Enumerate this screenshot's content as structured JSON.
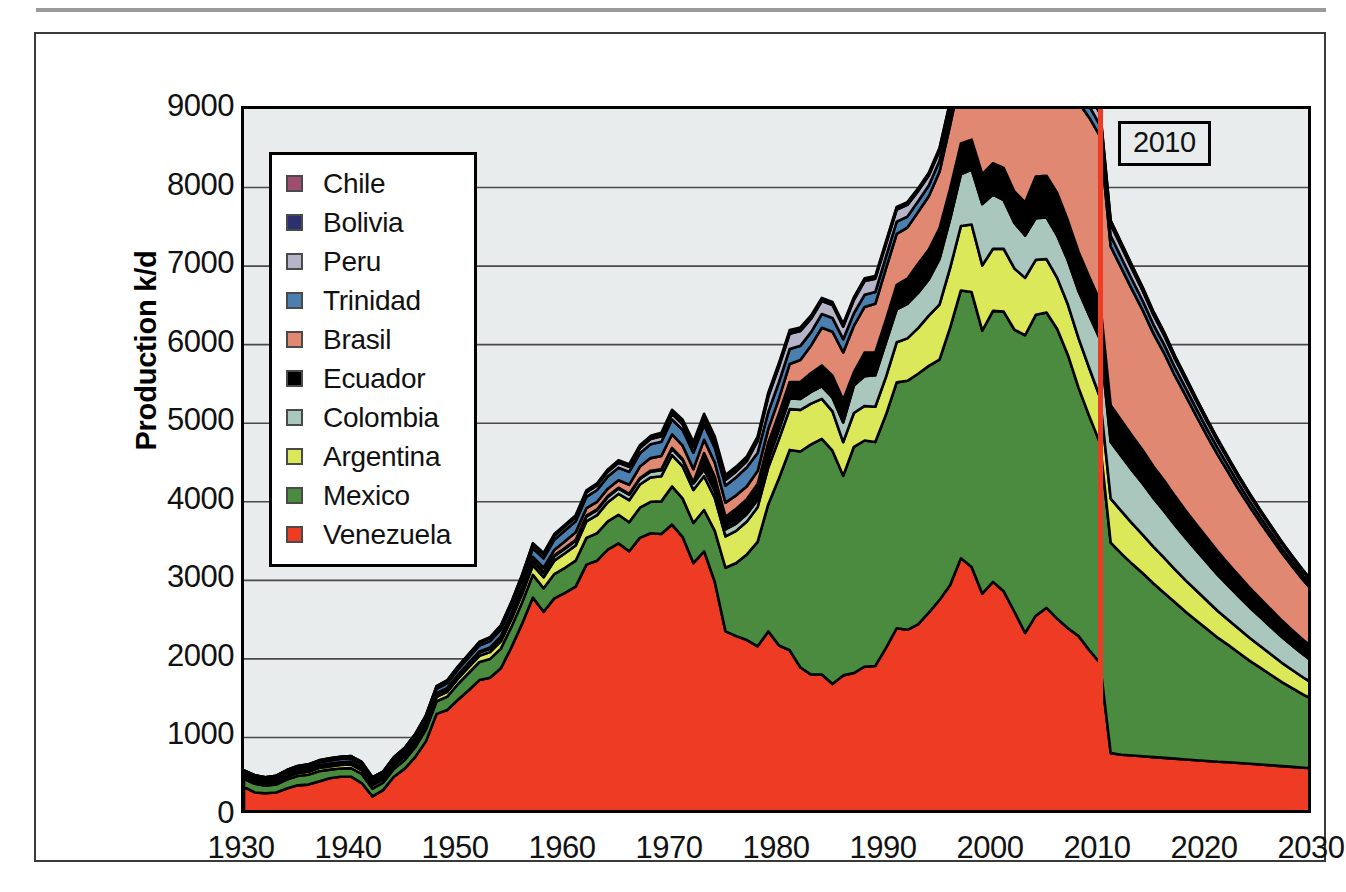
{
  "figure": {
    "title": "",
    "marker_label": "2010",
    "marker_year": 2010,
    "marker_color": "#ee3b24",
    "plot_background": "#e9ecec"
  },
  "axes": {
    "ylabel": "Production k/d",
    "yticks": [
      "0",
      "1000",
      "2000",
      "3000",
      "4000",
      "5000",
      "6000",
      "7000",
      "8000",
      "9000"
    ],
    "xticks": [
      "1930",
      "1940",
      "1950",
      "1960",
      "1970",
      "1980",
      "1990",
      "2000",
      "2010",
      "2020",
      "2030"
    ]
  },
  "legend": {
    "items": [
      {
        "label": "Chile",
        "color": "#9e4f6e"
      },
      {
        "label": "Bolivia",
        "color": "#2b3070"
      },
      {
        "label": "Peru",
        "color": "#b6b4c8"
      },
      {
        "label": "Trinidad",
        "color": "#4a7fb0"
      },
      {
        "label": "Brasil",
        "color": "#e08872"
      },
      {
        "label": "Ecuador",
        "color": "#000000"
      },
      {
        "label": "Colombia",
        "color": "#aac7bd"
      },
      {
        "label": "Argentina",
        "color": "#dbe85a"
      },
      {
        "label": "Mexico",
        "color": "#4b8b40"
      },
      {
        "label": "Venezuela",
        "color": "#ee3b24"
      }
    ]
  },
  "chart_data": {
    "type": "area",
    "stacked": true,
    "title": "",
    "xlabel": "",
    "ylabel": "Production k/d",
    "xlim": [
      1930,
      2030
    ],
    "ylim": [
      0,
      9000
    ],
    "grid": true,
    "legend_position": "inside-upper-left",
    "annotations": [
      {
        "type": "vline",
        "x": 2010,
        "label": "2010",
        "color": "#ee3b24"
      }
    ],
    "x": [
      1930,
      1931,
      1932,
      1933,
      1934,
      1935,
      1936,
      1937,
      1938,
      1939,
      1940,
      1941,
      1942,
      1943,
      1944,
      1945,
      1946,
      1947,
      1948,
      1949,
      1950,
      1951,
      1952,
      1953,
      1954,
      1955,
      1956,
      1957,
      1958,
      1959,
      1960,
      1961,
      1962,
      1963,
      1964,
      1965,
      1966,
      1967,
      1968,
      1969,
      1970,
      1971,
      1972,
      1973,
      1974,
      1975,
      1976,
      1977,
      1978,
      1979,
      1980,
      1981,
      1982,
      1983,
      1984,
      1985,
      1986,
      1987,
      1988,
      1989,
      1990,
      1991,
      1992,
      1993,
      1994,
      1995,
      1996,
      1997,
      1998,
      1999,
      2000,
      2001,
      2002,
      2003,
      2004,
      2005,
      2006,
      2007,
      2008,
      2009,
      2010,
      2011,
      2012,
      2013,
      2014,
      2015,
      2016,
      2017,
      2018,
      2019,
      2020,
      2021,
      2022,
      2023,
      2024,
      2025,
      2026,
      2027,
      2028,
      2029,
      2030
    ],
    "series": [
      {
        "name": "Venezuela",
        "color": "#ee3b24",
        "values": [
          370,
          300,
          290,
          300,
          350,
          390,
          400,
          440,
          480,
          500,
          500,
          420,
          250,
          330,
          500,
          600,
          750,
          950,
          1300,
          1350,
          1480,
          1600,
          1730,
          1760,
          1880,
          2150,
          2450,
          2780,
          2600,
          2770,
          2840,
          2920,
          3200,
          3250,
          3390,
          3470,
          3370,
          3540,
          3600,
          3590,
          3710,
          3550,
          3220,
          3370,
          2980,
          2350,
          2290,
          2240,
          2160,
          2350,
          2170,
          2110,
          1890,
          1800,
          1800,
          1680,
          1790,
          1820,
          1900,
          1910,
          2140,
          2390,
          2370,
          2440,
          2590,
          2750,
          2940,
          3280,
          3170,
          2830,
          2980,
          2860,
          2600,
          2330,
          2550,
          2650,
          2510,
          2390,
          2290,
          2110,
          1950,
          800,
          780,
          770,
          760,
          750,
          740,
          730,
          720,
          710,
          700,
          690,
          685,
          675,
          665,
          655,
          645,
          635,
          625,
          615,
          605
        ]
      },
      {
        "name": "Mexico",
        "color": "#4b8b40",
        "values": [
          105,
          110,
          95,
          100,
          115,
          120,
          125,
          130,
          110,
          105,
          110,
          115,
          100,
          95,
          100,
          110,
          125,
          150,
          160,
          170,
          200,
          220,
          230,
          240,
          250,
          260,
          270,
          290,
          300,
          310,
          320,
          330,
          340,
          350,
          360,
          365,
          370,
          385,
          400,
          415,
          485,
          490,
          510,
          525,
          650,
          810,
          930,
          1090,
          1330,
          1620,
          2130,
          2550,
          2750,
          2930,
          3000,
          2970,
          2540,
          2880,
          2880,
          2850,
          2970,
          3130,
          3170,
          3190,
          3140,
          3060,
          3280,
          3410,
          3500,
          3350,
          3450,
          3560,
          3590,
          3790,
          3830,
          3760,
          3690,
          3480,
          3160,
          2980,
          2800,
          2680,
          2560,
          2440,
          2330,
          2210,
          2100,
          1990,
          1880,
          1780,
          1680,
          1580,
          1490,
          1400,
          1310,
          1230,
          1150,
          1070,
          1000,
          930,
          870
        ]
      },
      {
        "name": "Argentina",
        "color": "#dbe85a",
        "values": [
          28,
          30,
          30,
          32,
          34,
          36,
          38,
          40,
          42,
          44,
          46,
          46,
          44,
          42,
          44,
          46,
          50,
          54,
          58,
          62,
          68,
          74,
          80,
          86,
          92,
          98,
          108,
          120,
          140,
          170,
          185,
          195,
          210,
          230,
          245,
          265,
          280,
          295,
          310,
          320,
          400,
          410,
          420,
          430,
          420,
          400,
          410,
          420,
          440,
          470,
          500,
          520,
          530,
          520,
          510,
          500,
          430,
          430,
          440,
          450,
          480,
          510,
          540,
          580,
          640,
          700,
          760,
          820,
          860,
          830,
          790,
          800,
          780,
          730,
          700,
          680,
          650,
          640,
          630,
          610,
          580,
          560,
          540,
          515,
          490,
          465,
          445,
          420,
          400,
          380,
          360,
          340,
          320,
          305,
          290,
          275,
          260,
          245,
          230,
          218,
          205
        ]
      },
      {
        "name": "Colombia",
        "color": "#aac7bd",
        "values": [
          20,
          20,
          20,
          21,
          22,
          23,
          24,
          25,
          26,
          26,
          27,
          27,
          25,
          24,
          25,
          26,
          28,
          30,
          32,
          35,
          38,
          40,
          42,
          44,
          46,
          48,
          50,
          52,
          54,
          56,
          58,
          60,
          62,
          64,
          66,
          68,
          70,
          72,
          74,
          76,
          80,
          82,
          84,
          86,
          88,
          90,
          92,
          94,
          96,
          98,
          120,
          135,
          140,
          150,
          160,
          175,
          250,
          350,
          380,
          400,
          440,
          420,
          440,
          450,
          460,
          580,
          620,
          660,
          700,
          780,
          690,
          620,
          580,
          540,
          530,
          530,
          540,
          560,
          600,
          670,
          740,
          720,
          700,
          675,
          650,
          620,
          595,
          565,
          540,
          510,
          485,
          460,
          435,
          410,
          390,
          368,
          348,
          328,
          310,
          292,
          275
        ]
      },
      {
        "name": "Ecuador",
        "color": "#000000",
        "values": [
          9,
          9,
          9,
          9,
          9,
          10,
          10,
          10,
          10,
          10,
          10,
          10,
          9,
          9,
          9,
          10,
          10,
          10,
          11,
          11,
          11,
          11,
          11,
          11,
          11,
          11,
          11,
          11,
          11,
          11,
          11,
          11,
          11,
          11,
          11,
          11,
          11,
          11,
          12,
          12,
          12,
          12,
          12,
          210,
          180,
          160,
          190,
          190,
          200,
          215,
          205,
          210,
          215,
          240,
          265,
          280,
          290,
          170,
          300,
          290,
          290,
          310,
          320,
          370,
          380,
          390,
          390,
          390,
          380,
          380,
          400,
          410,
          400,
          420,
          530,
          530,
          540,
          510,
          500,
          490,
          485,
          470,
          455,
          440,
          425,
          405,
          390,
          370,
          350,
          332,
          315,
          298,
          281,
          266,
          250,
          236,
          222,
          210,
          197,
          186,
          175
        ]
      },
      {
        "name": "Brasil",
        "color": "#e08872",
        "values": [
          0,
          0,
          0,
          0,
          0,
          0,
          0,
          0,
          0,
          0,
          0,
          0,
          0,
          1,
          1,
          2,
          2,
          3,
          3,
          3,
          3,
          3,
          3,
          5,
          8,
          12,
          25,
          45,
          55,
          70,
          85,
          95,
          95,
          95,
          95,
          95,
          115,
          145,
          160,
          170,
          170,
          170,
          170,
          170,
          180,
          180,
          170,
          165,
          165,
          175,
          190,
          230,
          280,
          350,
          480,
          560,
          600,
          590,
          580,
          620,
          650,
          650,
          650,
          660,
          680,
          720,
          810,
          880,
          1000,
          1150,
          1280,
          1340,
          1500,
          1550,
          1540,
          1720,
          1810,
          1830,
          1900,
          2030,
          2100,
          2020,
          1940,
          1860,
          1780,
          1690,
          1620,
          1530,
          1460,
          1380,
          1300,
          1230,
          1160,
          1090,
          1030,
          970,
          915,
          860,
          810,
          762,
          715
        ]
      },
      {
        "name": "Trinidad",
        "color": "#4a7fb0",
        "values": [
          25,
          26,
          27,
          28,
          30,
          32,
          34,
          36,
          38,
          40,
          42,
          43,
          40,
          38,
          40,
          42,
          46,
          50,
          55,
          60,
          65,
          70,
          75,
          80,
          85,
          92,
          100,
          110,
          120,
          130,
          135,
          140,
          145,
          150,
          155,
          160,
          165,
          170,
          175,
          180,
          190,
          200,
          210,
          190,
          190,
          215,
          230,
          240,
          230,
          215,
          210,
          190,
          180,
          170,
          175,
          175,
          170,
          160,
          155,
          150,
          150,
          155,
          140,
          135,
          135,
          140,
          140,
          135,
          130,
          135,
          140,
          135,
          155,
          165,
          155,
          170,
          175,
          155,
          150,
          145,
          140,
          136,
          131,
          126,
          121,
          116,
          110,
          105,
          100,
          94,
          89,
          84,
          79,
          75,
          70,
          66,
          62,
          58,
          55,
          51,
          48
        ]
      },
      {
        "name": "Peru",
        "color": "#b6b4c8",
        "values": [
          22,
          22,
          21,
          21,
          22,
          22,
          23,
          23,
          24,
          24,
          24,
          24,
          22,
          22,
          23,
          24,
          25,
          26,
          28,
          30,
          32,
          34,
          36,
          38,
          40,
          42,
          44,
          46,
          48,
          50,
          52,
          54,
          56,
          58,
          60,
          62,
          64,
          66,
          68,
          70,
          72,
          72,
          72,
          72,
          72,
          72,
          75,
          80,
          155,
          195,
          195,
          195,
          190,
          170,
          165,
          165,
          160,
          170,
          175,
          170,
          160,
          155,
          150,
          130,
          128,
          125,
          122,
          120,
          118,
          110,
          100,
          98,
          98,
          94,
          94,
          111,
          116,
          114,
          120,
          145,
          150,
          145,
          140,
          135,
          129,
          123,
          117,
          111,
          105,
          99,
          94,
          88,
          83,
          78,
          74,
          70,
          66,
          62,
          58,
          55,
          51
        ]
      },
      {
        "name": "Bolivia",
        "color": "#2b3070",
        "values": [
          2,
          2,
          2,
          2,
          3,
          3,
          3,
          4,
          4,
          4,
          4,
          4,
          4,
          4,
          5,
          5,
          5,
          6,
          6,
          6,
          6,
          7,
          7,
          8,
          8,
          9,
          9,
          10,
          10,
          11,
          11,
          12,
          12,
          13,
          14,
          15,
          16,
          18,
          20,
          24,
          28,
          32,
          36,
          40,
          44,
          38,
          36,
          34,
          32,
          30,
          28,
          26,
          25,
          24,
          23,
          22,
          21,
          20,
          22,
          22,
          23,
          24,
          25,
          25,
          26,
          28,
          30,
          32,
          34,
          36,
          37,
          38,
          38,
          42,
          46,
          50,
          52,
          52,
          52,
          50,
          48,
          46,
          44,
          42,
          40,
          38,
          36,
          34,
          32,
          30,
          28,
          27,
          25,
          24,
          22,
          21,
          20,
          19,
          17,
          16,
          15
        ]
      },
      {
        "name": "Chile",
        "color": "#9e4f6e",
        "values": [
          0,
          0,
          0,
          0,
          0,
          0,
          0,
          0,
          0,
          0,
          0,
          0,
          0,
          0,
          0,
          1,
          1,
          1,
          1,
          1,
          2,
          3,
          4,
          5,
          6,
          7,
          8,
          9,
          10,
          11,
          12,
          13,
          14,
          15,
          16,
          17,
          18,
          19,
          20,
          22,
          24,
          26,
          28,
          28,
          27,
          26,
          25,
          24,
          23,
          22,
          21,
          20,
          19,
          18,
          17,
          16,
          15,
          14,
          13,
          12,
          11,
          10,
          10,
          9,
          9,
          9,
          8,
          8,
          8,
          7,
          7,
          6,
          6,
          6,
          5,
          5,
          5,
          5,
          4,
          4,
          4,
          4,
          4,
          3,
          3,
          3,
          3,
          3,
          2,
          2,
          2,
          2,
          2,
          2,
          2,
          2,
          2,
          1,
          1,
          1,
          1
        ]
      }
    ]
  }
}
